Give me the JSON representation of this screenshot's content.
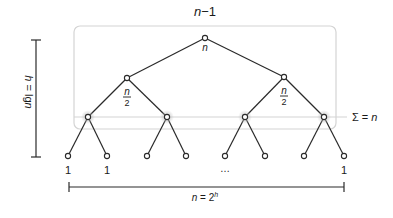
{
  "diagram": {
    "title": "n−1",
    "root_label": "n",
    "level2_labels": [
      "n",
      "2"
    ],
    "sum_label": "Σ = n",
    "leaf_labels": [
      "1",
      "1",
      "…",
      "1"
    ],
    "height_label": "h = lgn",
    "width_label_base": "n = 2",
    "width_label_exp": "h",
    "colors": {
      "line": "#2a2a2a",
      "box": "#d4d4d4",
      "halo": "#bdbdbd",
      "text": "#1a1a1a"
    },
    "nodes": {
      "root": {
        "x": 205,
        "y": 38
      },
      "level2": [
        {
          "x": 127,
          "y": 78
        },
        {
          "x": 284,
          "y": 77
        }
      ],
      "level3": [
        {
          "x": 88,
          "y": 117
        },
        {
          "x": 167,
          "y": 117
        },
        {
          "x": 245,
          "y": 117
        },
        {
          "x": 324,
          "y": 117
        }
      ],
      "leaves": [
        {
          "x": 68,
          "y": 156
        },
        {
          "x": 107,
          "y": 156
        },
        {
          "x": 147,
          "y": 156
        },
        {
          "x": 186,
          "y": 156
        },
        {
          "x": 225,
          "y": 156
        },
        {
          "x": 265,
          "y": 156
        },
        {
          "x": 304,
          "y": 156
        },
        {
          "x": 344,
          "y": 156
        }
      ]
    }
  }
}
